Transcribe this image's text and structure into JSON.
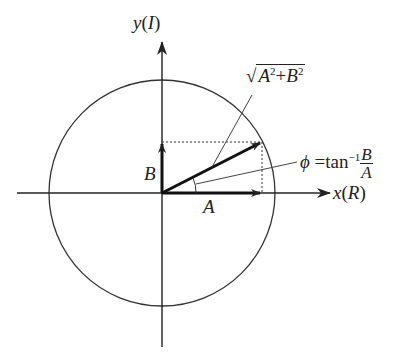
{
  "diagram": {
    "axes": {
      "x_label": "x",
      "x_paren": "R",
      "y_label": "y",
      "y_paren": "I"
    },
    "vectors": {
      "a_label": "A",
      "b_label": "B"
    },
    "magnitude": {
      "prefix": "√",
      "a": "A",
      "plus": "+",
      "b": "B",
      "exp": "2"
    },
    "phase": {
      "phi": "ϕ",
      "eq": "=tan",
      "exp": "−1",
      "num": "B",
      "den": "A"
    },
    "colors": {
      "stroke": "#222222",
      "background": "#ffffff"
    }
  }
}
